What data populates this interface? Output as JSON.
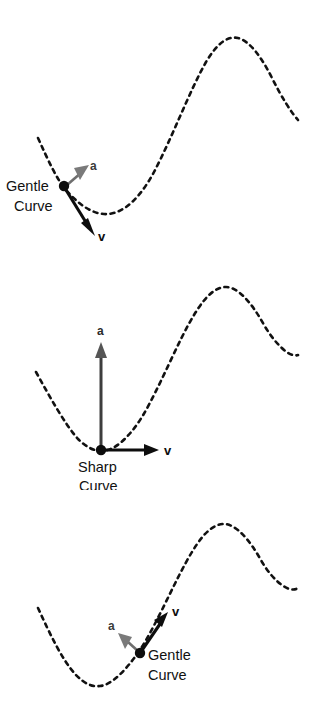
{
  "figure": {
    "background_color": "#ffffff",
    "curve_color": "#111111",
    "velocity_color": "#0d0d0d",
    "acceleration_color": "#6e6e6e"
  },
  "panels": [
    {
      "id": "panel-1",
      "caption_line1": "Gentle",
      "caption_line2": "Curve",
      "velocity_label": "v",
      "acceleration_label": "a",
      "point_position": {
        "x": 64,
        "y": 186
      },
      "velocity_direction": "down-right",
      "acceleration_direction": "up-right",
      "curve_description": "descending slope into valley then rising to peak"
    },
    {
      "id": "panel-2",
      "caption_line1": "Sharp",
      "caption_line2": "Curve",
      "velocity_label": "v",
      "acceleration_label": "a",
      "point_position": {
        "x": 101,
        "y": 205
      },
      "velocity_direction": "right",
      "acceleration_direction": "up",
      "curve_description": "point at bottom of valley, curve rises to peak at right"
    },
    {
      "id": "panel-3",
      "caption_line1": "Gentle",
      "caption_line2": "Curve",
      "velocity_label": "v",
      "acceleration_label": "a",
      "point_position": {
        "x": 140,
        "y": 163
      },
      "velocity_direction": "up-right",
      "acceleration_direction": "up-left",
      "curve_description": "point on rising slope past the valley, curve continues to peak"
    }
  ]
}
